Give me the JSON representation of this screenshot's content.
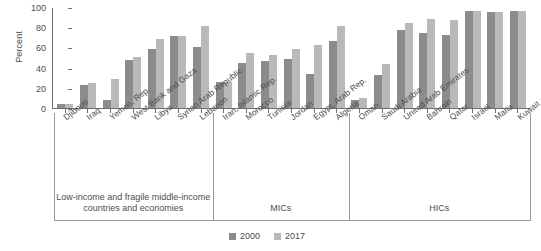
{
  "chart_data": {
    "type": "bar",
    "title": "",
    "xlabel": "",
    "ylabel": "Percent",
    "ylim": [
      0,
      100
    ],
    "yticks": [
      0,
      20,
      40,
      60,
      80,
      100
    ],
    "grid": false,
    "legend_position": "bottom-center",
    "categories": [
      "Djibouti",
      "Iraq",
      "Yemen, Rep.",
      "West Bank and Gaza",
      "Libya",
      "Syrian Arab Republic",
      "Lebanon",
      "Iran, Islamic Rep.",
      "Morocco",
      "Tunisia",
      "Jordan",
      "Egypt, Arab Rep.",
      "Algeria",
      "Oman",
      "Saudi Arabia",
      "United Arab Emirates",
      "Bahrain",
      "Qatar",
      "Israel",
      "Malta",
      "Kuwait"
    ],
    "series": [
      {
        "name": "2000",
        "color": "#8c8c8c",
        "values": [
          4,
          23,
          8,
          48,
          58,
          71,
          60,
          26,
          45,
          47,
          49,
          34,
          66,
          8,
          33,
          77,
          74,
          72,
          96,
          95,
          96
        ]
      },
      {
        "name": "2017",
        "color": "#b9b9b9",
        "values": [
          4,
          25,
          29,
          51,
          68,
          71,
          81,
          26,
          54,
          52,
          58,
          62,
          81,
          10,
          44,
          84,
          88,
          87,
          96,
          95,
          96
        ]
      }
    ],
    "groups": [
      {
        "label": "Low-income and fragile middle-income countries and economies",
        "start": 0,
        "count": 7
      },
      {
        "label": "MICs",
        "start": 7,
        "count": 6
      },
      {
        "label": "HICs",
        "start": 13,
        "count": 8
      }
    ]
  }
}
